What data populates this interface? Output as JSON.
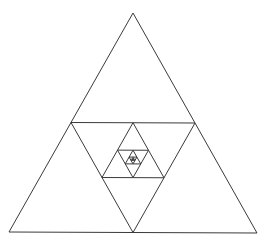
{
  "diagram": {
    "type": "nested-medial-triangles",
    "background": "#ffffff",
    "stroke_color": "#3a3a3a",
    "stroke_width": 1,
    "outer_triangle": {
      "apex": [
        133,
        13
      ],
      "bottom_left": [
        9,
        232
      ],
      "bottom_right": [
        257,
        233
      ]
    },
    "levels": 9
  }
}
